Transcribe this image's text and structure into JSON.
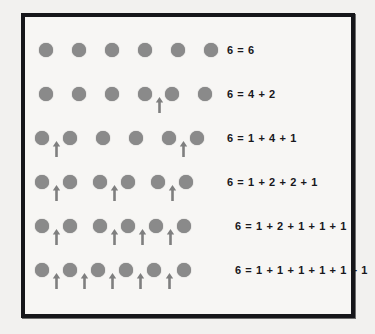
{
  "figure": {
    "total": 6,
    "colors": {
      "page_background": "#f2f1ef",
      "panel_background": "#f7f6f4",
      "border": "#16161a",
      "dot": "#8a8a8a",
      "arrow": "#7f7f7f",
      "text": "#18181c"
    },
    "rows": [
      {
        "equation": "6 = 6",
        "parts": [
          6
        ],
        "dot_count": 6,
        "arrow_gaps": [],
        "dot_x": [
          8,
          41,
          74,
          107,
          140,
          173
        ],
        "arrow_x": [],
        "row_top": 18,
        "equation_left": 202
      },
      {
        "equation": "6 = 4 + 2",
        "parts": [
          4,
          2
        ],
        "dot_count": 6,
        "arrow_gaps": [
          4
        ],
        "dot_x": [
          8,
          41,
          74,
          107,
          134,
          167
        ],
        "arrow_x": [
          124
        ],
        "row_top": 62,
        "equation_left": 202
      },
      {
        "equation": "6 = 1 + 4 + 1",
        "parts": [
          1,
          4,
          1
        ],
        "dot_count": 6,
        "arrow_gaps": [
          1,
          5
        ],
        "dot_x": [
          4,
          32,
          65,
          98,
          131,
          159
        ],
        "arrow_x": [
          21,
          148
        ],
        "row_top": 106,
        "equation_left": 202
      },
      {
        "equation": "6 = 1 + 2 + 2 + 1",
        "parts": [
          1,
          2,
          2,
          1
        ],
        "dot_count": 6,
        "arrow_gaps": [
          1,
          3,
          5
        ],
        "dot_x": [
          4,
          32,
          62,
          90,
          120,
          148
        ],
        "arrow_x": [
          21,
          79,
          137
        ],
        "row_top": 150,
        "equation_left": 202
      },
      {
        "equation": "6 = 1 + 2 + 1 + 1 + 1",
        "parts": [
          1,
          2,
          1,
          1,
          1
        ],
        "dot_count": 6,
        "arrow_gaps": [
          1,
          3,
          4,
          5
        ],
        "dot_x": [
          4,
          32,
          62,
          90,
          118,
          146
        ],
        "arrow_x": [
          21,
          79,
          107,
          135
        ],
        "row_top": 194,
        "equation_left": 210
      },
      {
        "equation": "6 = 1 + 1 + 1 + 1 + 1 + 1",
        "parts": [
          1,
          1,
          1,
          1,
          1,
          1
        ],
        "dot_count": 6,
        "arrow_gaps": [
          1,
          2,
          3,
          4,
          5
        ],
        "dot_x": [
          4,
          32,
          60,
          88,
          116,
          146
        ],
        "arrow_x": [
          21,
          49,
          77,
          105,
          134
        ],
        "row_top": 238,
        "equation_left": 210
      }
    ]
  }
}
